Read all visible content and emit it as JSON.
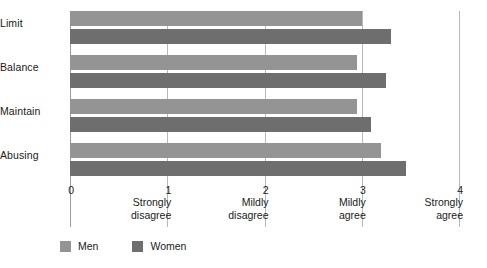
{
  "chart_data": {
    "type": "bar",
    "orientation": "horizontal",
    "title": "",
    "xlabel": "",
    "ylabel": "",
    "categories": [
      "Limit",
      "Balance",
      "Maintain",
      "Abusing"
    ],
    "series": [
      {
        "name": "Men",
        "color": "#949494",
        "values": [
          3.0,
          2.95,
          2.95,
          3.2
        ]
      },
      {
        "name": "Women",
        "color": "#6e6e6e",
        "values": [
          3.3,
          3.25,
          3.1,
          3.45
        ]
      }
    ],
    "xlim": [
      0,
      4
    ],
    "xticks": [
      {
        "value": 0,
        "num": "0",
        "line1": "",
        "line2": ""
      },
      {
        "value": 1,
        "num": "1",
        "line1": "Strongly",
        "line2": "disagree"
      },
      {
        "value": 2,
        "num": "2",
        "line1": "Mildly",
        "line2": "disagree"
      },
      {
        "value": 3,
        "num": "3",
        "line1": "Mildly",
        "line2": "agree"
      },
      {
        "value": 4,
        "num": "4",
        "line1": "Strongly",
        "line2": "agree"
      }
    ],
    "grid": "vertical-only",
    "legend_position": "bottom-left",
    "legend": [
      "Men",
      "Women"
    ]
  }
}
